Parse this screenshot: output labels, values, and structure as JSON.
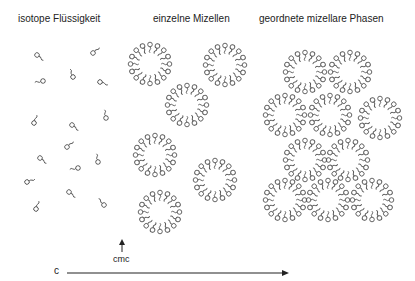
{
  "titles": {
    "left": "isotope Flüssigkeit",
    "middle": "einzelne Mizellen",
    "right": "geordnete mizellare Phasen"
  },
  "axis": {
    "label": "c",
    "marker": "cmc"
  },
  "colors": {
    "stroke": "#555555",
    "text": "#222222"
  },
  "monomers": [
    [
      37,
      55,
      40
    ],
    [
      93,
      53,
      -40
    ],
    [
      43,
      81,
      170
    ],
    [
      73,
      77,
      -110
    ],
    [
      100,
      82,
      20
    ],
    [
      34,
      123,
      -70
    ],
    [
      72,
      125,
      40
    ],
    [
      106,
      118,
      -100
    ],
    [
      40,
      158,
      40
    ],
    [
      67,
      147,
      -40
    ],
    [
      78,
      168,
      170
    ],
    [
      98,
      162,
      -100
    ],
    [
      27,
      182,
      -20
    ],
    [
      69,
      192,
      40
    ],
    [
      36,
      209,
      -70
    ],
    [
      104,
      205,
      -130
    ]
  ],
  "micelles": {
    "single": [
      [
        150,
        64
      ],
      [
        225,
        65
      ],
      [
        187,
        105
      ],
      [
        155,
        155
      ],
      [
        215,
        180
      ],
      [
        160,
        212
      ]
    ],
    "ordered": [
      [
        305,
        72
      ],
      [
        350,
        72
      ],
      [
        285,
        115
      ],
      [
        330,
        115
      ],
      [
        380,
        118
      ],
      [
        305,
        160
      ],
      [
        348,
        160
      ],
      [
        285,
        200
      ],
      [
        328,
        200
      ],
      [
        372,
        200
      ]
    ]
  }
}
